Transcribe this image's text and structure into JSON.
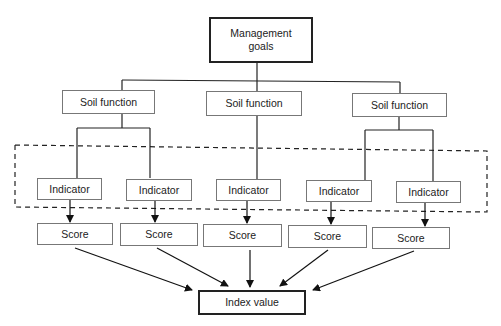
{
  "diagram": {
    "type": "hierarchy-flowchart",
    "root": {
      "label_line1": "Management",
      "label_line2": "goals"
    },
    "soil_functions": [
      {
        "label": "Soil function"
      },
      {
        "label": "Soil function"
      },
      {
        "label": "Soil function"
      }
    ],
    "indicators": [
      {
        "label": "Indicator",
        "parent": 0
      },
      {
        "label": "Indicator",
        "parent": 0
      },
      {
        "label": "Indicator",
        "parent": 1
      },
      {
        "label": "Indicator",
        "parent": 2
      },
      {
        "label": "Indicator",
        "parent": 2
      }
    ],
    "scores": [
      {
        "label": "Score"
      },
      {
        "label": "Score"
      },
      {
        "label": "Score"
      },
      {
        "label": "Score"
      },
      {
        "label": "Score"
      }
    ],
    "output": {
      "label": "Index value"
    },
    "grouping": {
      "style": "dashed",
      "encloses": "indicators"
    },
    "colors": {
      "line": "#222222",
      "box_border": "#777777",
      "strong_border": "#222222",
      "background": "#ffffff"
    }
  }
}
